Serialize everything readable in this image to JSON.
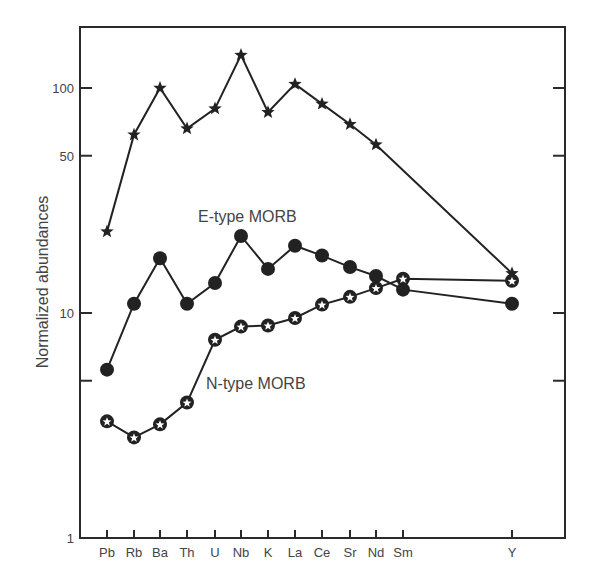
{
  "chart_data": {
    "type": "line",
    "title": "",
    "xlabel": "",
    "ylabel": "Normalized abundances",
    "yscale": "log",
    "ylim": [
      1,
      200
    ],
    "grid": false,
    "legend_position": "inline labels",
    "y_ticks": [
      {
        "value": 1,
        "label": "1"
      },
      {
        "value": 5,
        "label": ""
      },
      {
        "value": 10,
        "label": "10"
      },
      {
        "value": 50,
        "label": "50"
      },
      {
        "value": 100,
        "label": "100"
      }
    ],
    "categories": [
      "Pb",
      "Rb",
      "Ba",
      "Th",
      "U",
      "Nb",
      "K",
      "La",
      "Ce",
      "Sr",
      "Nd",
      "Sm",
      "Y"
    ],
    "x_positions": [
      107,
      134,
      160,
      187,
      215,
      241,
      268,
      295,
      322,
      350,
      376,
      403,
      512
    ],
    "series": [
      {
        "name": "unlabeled (star markers)",
        "marker": "star",
        "label": "",
        "values": [
          23,
          62,
          100,
          66,
          81,
          140,
          78,
          104,
          85,
          69,
          56,
          null,
          15
        ]
      },
      {
        "name": "E-type MORB",
        "marker": "filled-circle",
        "label": "E-type MORB",
        "values": [
          5.6,
          11,
          17.5,
          11,
          13.6,
          22,
          15.7,
          19.9,
          18,
          16,
          14.6,
          12.7,
          11
        ]
      },
      {
        "name": "N-type MORB",
        "marker": "circle-with-star",
        "label": "N-type MORB",
        "values": [
          3.3,
          2.8,
          3.2,
          4.0,
          7.6,
          8.7,
          8.8,
          9.5,
          10.9,
          11.8,
          12.9,
          14.2,
          13.9
        ]
      }
    ],
    "annotations": [
      {
        "text": "E-type MORB",
        "x": 198,
        "y": 222
      },
      {
        "text": "N-type MORB",
        "x": 206,
        "y": 389
      }
    ]
  }
}
